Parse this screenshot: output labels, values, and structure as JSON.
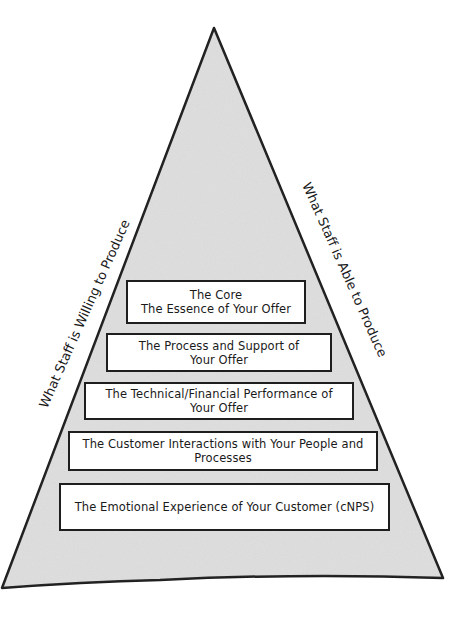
{
  "diagram": {
    "type": "pyramid",
    "colors": {
      "fill": "#e0e0e0",
      "outline": "#1e1e1e",
      "box_fill": "#ffffff",
      "background": "#ffffff"
    },
    "left_label": "What Staff is Willing to Produce",
    "right_label": "What Staff is Able to Produce",
    "layers": [
      {
        "line1": "The Core",
        "line2": "The Essence of Your Offer"
      },
      {
        "line1": "The Process and Support of",
        "line2": "Your Offer"
      },
      {
        "line1": "The Technical/Financial Performance of",
        "line2": "Your Offer"
      },
      {
        "line1": "The Customer Interactions with Your People and",
        "line2": "Processes"
      },
      {
        "line1": "The Emotional Experience of Your Customer (cNPS)",
        "line2": ""
      }
    ]
  }
}
